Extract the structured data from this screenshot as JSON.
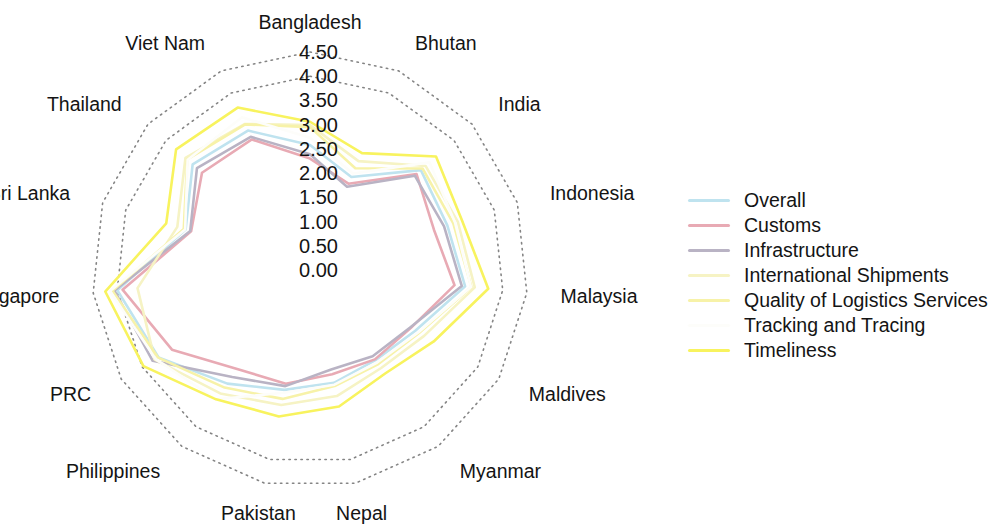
{
  "chart_data": {
    "type": "radar",
    "title": "",
    "xlabel": "",
    "ylabel": "",
    "rlim": [
      0.0,
      4.5
    ],
    "r_tick_step": 0.5,
    "grid": true,
    "grid_rings_visible": [
      4.5,
      4.0
    ],
    "legend_position": "right",
    "tick_labels": [
      "4.50",
      "4.00",
      "3.50",
      "3.00",
      "2.50",
      "2.00",
      "1.50",
      "1.00",
      "0.50",
      "0.00"
    ],
    "tick_values": [
      4.5,
      4.0,
      3.5,
      3.0,
      2.5,
      2.0,
      1.5,
      1.0,
      0.5,
      0.0
    ],
    "categories": [
      "Bangladesh",
      "Bhutan",
      "India",
      "Indonesia",
      "Malaysia",
      "Maldives",
      "Myanmar",
      "Nepal",
      "Pakistan",
      "Philippines",
      "PRC",
      "Singapore",
      "Sri Lanka",
      "Thailand",
      "Viet Nam"
    ],
    "series": [
      {
        "name": "Overall",
        "color": "#bfe3ef",
        "values": [
          2.58,
          2.1,
          3.08,
          2.98,
          3.22,
          2.51,
          2.3,
          2.38,
          2.53,
          2.9,
          3.61,
          4.0,
          2.7,
          3.26,
          3.15
        ]
      },
      {
        "name": "Customs",
        "color": "#e8aab4",
        "values": [
          2.3,
          1.95,
          2.96,
          2.69,
          3.0,
          2.4,
          2.28,
          2.2,
          2.4,
          2.53,
          3.29,
          3.89,
          2.58,
          3.0,
          2.95
        ]
      },
      {
        "name": "Infrastructure",
        "color": "#b9b3c4",
        "values": [
          2.39,
          1.88,
          2.91,
          2.91,
          3.15,
          2.38,
          2.2,
          2.1,
          2.45,
          2.73,
          3.75,
          4.06,
          2.6,
          3.14,
          3.01
        ]
      },
      {
        "name": "International Shipments",
        "color": "#f6f3c4",
        "values": [
          2.99,
          2.46,
          3.21,
          3.21,
          3.42,
          2.72,
          2.5,
          2.66,
          2.85,
          3.15,
          3.7,
          3.58,
          2.88,
          3.46,
          3.3
        ]
      },
      {
        "name": "Quality of Logistics Services",
        "color": "#f7f2a8",
        "values": [
          2.95,
          2.3,
          3.13,
          3.11,
          3.35,
          2.6,
          2.4,
          2.45,
          2.72,
          3.0,
          3.62,
          4.1,
          2.74,
          3.41,
          3.29
        ]
      },
      {
        "name": "Tracking and Tracing",
        "color": "#fdfdfa",
        "values": [
          2.73,
          2.18,
          3.32,
          3.15,
          3.34,
          2.58,
          2.36,
          2.42,
          2.59,
          3.3,
          3.68,
          4.15,
          2.71,
          3.4,
          3.45
        ]
      },
      {
        "name": "Timeliness",
        "color": "#f8f35e",
        "values": [
          3.06,
          2.64,
          3.5,
          3.3,
          3.7,
          2.95,
          2.64,
          2.88,
          3.09,
          3.3,
          3.97,
          4.25,
          3.12,
          3.72,
          3.67
        ]
      }
    ]
  },
  "legend": {
    "items": [
      {
        "label": "Overall"
      },
      {
        "label": "Customs"
      },
      {
        "label": "Infrastructure"
      },
      {
        "label": "International Shipments"
      },
      {
        "label": "Quality of Logistics Services"
      },
      {
        "label": "Tracking and Tracing"
      },
      {
        "label": "Timeliness"
      }
    ]
  }
}
